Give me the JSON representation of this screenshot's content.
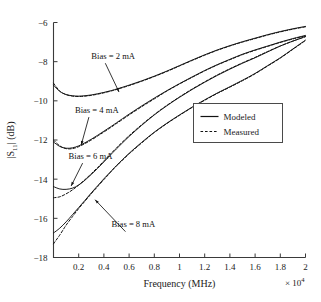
{
  "chart_data": {
    "type": "line",
    "title": "",
    "xlabel": "Frequency (MHz)",
    "ylabel": "|S11| (dB)",
    "ylabel_parts": {
      "base": "|S",
      "sub": "11",
      "tail": "| (dB)"
    },
    "x_multiplier": "× 10",
    "x_multiplier_exp": "4",
    "xlim": [
      0,
      2
    ],
    "ylim": [
      -18,
      -6
    ],
    "xticks": [
      0.2,
      0.4,
      0.6,
      0.8,
      1,
      1.2,
      1.4,
      1.6,
      1.8,
      2
    ],
    "xtick_labels": [
      "0.2",
      "0.4",
      "0.6",
      "0.8",
      "1",
      "1.2",
      "1.4",
      "1.6",
      "1.8",
      "2"
    ],
    "yticks": [
      -6,
      -8,
      -10,
      -12,
      -14,
      -16,
      -18
    ],
    "ytick_labels": [
      "−6",
      "−8",
      "−10",
      "−12",
      "−14",
      "−16",
      "−18"
    ],
    "grid": false,
    "legend_position": "center-right",
    "legend": [
      {
        "label": "Modeled",
        "style": "solid"
      },
      {
        "label": "Measured",
        "style": "dashed"
      }
    ],
    "annotations": [
      {
        "text": "Bias = 2 mA",
        "label_x": 0.3,
        "label_y": -7.85,
        "arrow_to_x": 0.52,
        "arrow_to_y": -9.55
      },
      {
        "text": "Bias = 4 mA",
        "label_x": 0.17,
        "label_y": -10.6,
        "arrow_to_x": 0.22,
        "arrow_to_y": -12.25
      },
      {
        "text": "Bias = 6 mA",
        "label_x": 0.12,
        "label_y": -12.95,
        "arrow_to_x": 0.14,
        "arrow_to_y": -14.35
      },
      {
        "text": "Bias = 8 mA",
        "label_x": 0.46,
        "label_y": -16.45,
        "arrow_to_x": 0.33,
        "arrow_to_y": -15.05
      }
    ],
    "x": [
      0.0,
      0.05,
      0.1,
      0.15,
      0.2,
      0.25,
      0.3,
      0.35,
      0.4,
      0.45,
      0.5,
      0.6,
      0.7,
      0.8,
      0.9,
      1.0,
      1.1,
      1.2,
      1.3,
      1.4,
      1.5,
      1.6,
      1.7,
      1.8,
      1.9,
      2.0
    ],
    "series": [
      {
        "name": "Bias = 2 mA, Modeled",
        "style": "solid",
        "values": [
          -9.2,
          -9.52,
          -9.68,
          -9.74,
          -9.76,
          -9.74,
          -9.7,
          -9.64,
          -9.57,
          -9.49,
          -9.4,
          -9.2,
          -8.98,
          -8.74,
          -8.48,
          -8.2,
          -7.92,
          -7.65,
          -7.4,
          -7.18,
          -6.98,
          -6.8,
          -6.62,
          -6.46,
          -6.32,
          -6.2
        ]
      },
      {
        "name": "Bias = 2 mA, Measured",
        "style": "dashed",
        "values": [
          -9.1,
          -9.5,
          -9.68,
          -9.76,
          -9.78,
          -9.76,
          -9.72,
          -9.66,
          -9.59,
          -9.51,
          -9.42,
          -9.22,
          -9.0,
          -8.76,
          -8.5,
          -8.22,
          -7.94,
          -7.67,
          -7.42,
          -7.2,
          -7.0,
          -6.82,
          -6.64,
          -6.48,
          -6.34,
          -6.22
        ]
      },
      {
        "name": "Bias = 4 mA, Modeled",
        "style": "solid",
        "values": [
          -12.1,
          -12.33,
          -12.42,
          -12.4,
          -12.3,
          -12.14,
          -11.96,
          -11.76,
          -11.55,
          -11.34,
          -11.12,
          -10.68,
          -10.26,
          -9.86,
          -9.48,
          -9.12,
          -8.78,
          -8.45,
          -8.15,
          -7.88,
          -7.62,
          -7.4,
          -7.2,
          -7.0,
          -6.82,
          -6.66
        ]
      },
      {
        "name": "Bias = 4 mA, Measured",
        "style": "dashed",
        "values": [
          -12.0,
          -12.3,
          -12.44,
          -12.44,
          -12.34,
          -12.18,
          -12.0,
          -11.8,
          -11.59,
          -11.38,
          -11.16,
          -10.72,
          -10.3,
          -9.9,
          -9.5,
          -9.14,
          -8.8,
          -8.47,
          -8.17,
          -7.9,
          -7.64,
          -7.42,
          -7.22,
          -7.02,
          -6.84,
          -6.68
        ]
      },
      {
        "name": "Bias = 6 mA, Modeled",
        "style": "solid",
        "values": [
          -14.38,
          -14.5,
          -14.52,
          -14.46,
          -14.3,
          -14.05,
          -13.76,
          -13.45,
          -13.12,
          -12.78,
          -12.45,
          -11.82,
          -11.25,
          -10.72,
          -10.25,
          -9.82,
          -9.42,
          -9.05,
          -8.7,
          -8.38,
          -8.08,
          -7.8,
          -7.5,
          -7.2,
          -6.95,
          -6.72
        ]
      },
      {
        "name": "Bias = 6 mA, Measured",
        "style": "dashed",
        "values": [
          -14.95,
          -14.9,
          -14.75,
          -14.55,
          -14.3,
          -14.02,
          -13.72,
          -13.4,
          -13.07,
          -12.73,
          -12.4,
          -11.78,
          -11.22,
          -10.7,
          -10.23,
          -9.8,
          -9.4,
          -9.03,
          -8.68,
          -8.36,
          -8.06,
          -7.78,
          -7.48,
          -7.2,
          -6.95,
          -6.72
        ]
      },
      {
        "name": "Bias = 8 mA, Modeled",
        "style": "solid",
        "values": [
          -16.75,
          -16.5,
          -16.18,
          -15.82,
          -15.45,
          -15.08,
          -14.7,
          -14.34,
          -13.98,
          -13.64,
          -13.3,
          -12.68,
          -12.12,
          -11.6,
          -11.14,
          -10.72,
          -10.32,
          -9.95,
          -9.6,
          -9.28,
          -8.95,
          -8.6,
          -8.2,
          -7.8,
          -7.35,
          -6.9
        ]
      },
      {
        "name": "Bias = 8 mA, Measured",
        "style": "dashed",
        "values": [
          -17.3,
          -16.85,
          -16.35,
          -15.92,
          -15.5,
          -15.12,
          -14.74,
          -14.38,
          -14.02,
          -13.67,
          -13.33,
          -12.71,
          -12.15,
          -11.62,
          -11.16,
          -10.74,
          -10.34,
          -9.97,
          -9.62,
          -9.3,
          -8.97,
          -8.62,
          -8.22,
          -7.82,
          -7.37,
          -6.92
        ]
      }
    ]
  }
}
